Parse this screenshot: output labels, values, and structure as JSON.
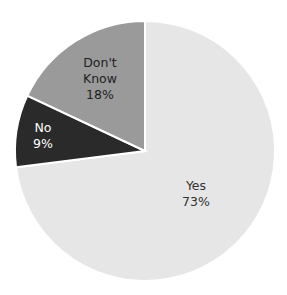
{
  "chart_data": {
    "type": "pie",
    "title": "",
    "start_angle_deg": 0,
    "direction": "clockwise",
    "categories": [
      "Yes",
      "No",
      "Don't Know"
    ],
    "values": [
      73,
      9,
      18
    ],
    "unit": "%",
    "colors": [
      "#e6e6e6",
      "#2a2a2a",
      "#9a9a9a"
    ],
    "edge_color": "#ffffff",
    "labels": [
      {
        "category": "Yes",
        "line1": "Yes",
        "line2": "73%",
        "text_color": "#333333"
      },
      {
        "category": "No",
        "line1": "No",
        "line2": "9%",
        "text_color": "#ffffff"
      },
      {
        "category": "Don't Know",
        "line1": "Don't",
        "line1b": "Know",
        "line2": "18%",
        "text_color": "#222222"
      }
    ],
    "legend": "none"
  }
}
